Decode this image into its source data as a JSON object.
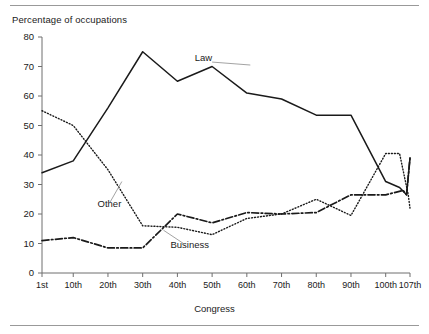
{
  "figure": {
    "top_rule": true,
    "bottom_rule": true,
    "rule_color": "#999999"
  },
  "chart_data": {
    "type": "line",
    "title": "",
    "ylabel": "Percentage of occupations",
    "xlabel": "Congress",
    "categories": [
      "1st",
      "10th",
      "20th",
      "30th",
      "40th",
      "50th",
      "60th",
      "70th",
      "80th",
      "90th",
      "100th",
      "107th"
    ],
    "x": [
      1,
      10,
      20,
      30,
      40,
      50,
      60,
      70,
      80,
      90,
      100,
      107
    ],
    "ylim": [
      0,
      80
    ],
    "yticks": [
      0,
      10,
      20,
      30,
      40,
      50,
      60,
      70,
      80
    ],
    "ytick_labels": [
      "0",
      "10",
      "20",
      "30",
      "40",
      "50",
      "60",
      "70",
      "80"
    ],
    "grid": false,
    "legend": "inline-annotations",
    "series": [
      {
        "name": "Law",
        "style": "solid",
        "color": "#1a1a1a",
        "label_x": 45,
        "label_y": 72,
        "values": [
          34,
          38,
          56,
          75,
          65,
          70,
          61,
          59,
          53.5,
          53.5,
          31,
          39
        ]
      },
      {
        "name": "Other",
        "style": "dotted",
        "color": "#1a1a1a",
        "label_x": 17,
        "label_y": 22.5,
        "values": [
          55,
          50,
          35,
          16,
          15.5,
          13,
          18.5,
          20,
          25,
          19.5,
          40.5,
          22
        ]
      },
      {
        "name": "Business",
        "style": "dashdot",
        "color": "#1a1a1a",
        "label_x": 38,
        "label_y": 8.5,
        "values": [
          11,
          12,
          8.5,
          8.5,
          20,
          17,
          20.5,
          20,
          20.5,
          26.5,
          26.5,
          39
        ]
      }
    ],
    "extra_vertices": {
      "Other": [
        [
          104,
          40.5
        ],
        [
          106.5,
          26.5
        ]
      ],
      "Law": [
        [
          104,
          29
        ],
        [
          106,
          26.5
        ]
      ],
      "Business": [
        [
          105,
          28
        ],
        [
          106,
          26.5
        ]
      ]
    }
  }
}
